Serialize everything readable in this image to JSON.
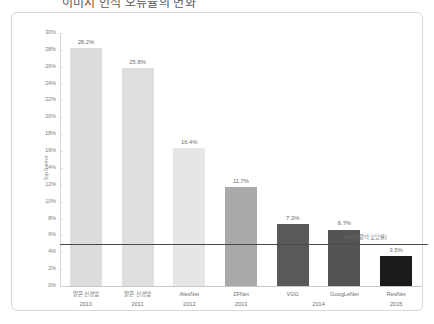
{
  "title": "이미지 인식 오류율의 변화",
  "chart_data": {
    "type": "bar",
    "title": "이미지 인식 오류율의 변화",
    "xlabel": "",
    "ylabel": "Top 5 error",
    "ylim": [
      0,
      30
    ],
    "ytick_step": 2,
    "grid": false,
    "legend": "none",
    "categories": [
      "얕은 신경망",
      "얕은 신경망",
      "AlexNet",
      "ZFNet",
      "VGG",
      "GoogLeNet",
      "ResNet"
    ],
    "values": [
      28.2,
      25.8,
      16.4,
      11.7,
      7.3,
      6.7,
      3.5
    ],
    "data_labels": [
      "28.2%",
      "25.8%",
      "16.4%",
      "11.7%",
      "7.3%",
      "6.7%",
      "3.5%"
    ],
    "years": [
      "2010",
      "2011",
      "2012",
      "2013",
      "2014",
      "2014",
      "2015"
    ],
    "year_groups": [
      {
        "label": "2010",
        "span": [
          0,
          0
        ]
      },
      {
        "label": "2011",
        "span": [
          1,
          1
        ]
      },
      {
        "label": "2012",
        "span": [
          2,
          2
        ]
      },
      {
        "label": "2013",
        "span": [
          3,
          3
        ]
      },
      {
        "label": "2014",
        "span": [
          4,
          5
        ]
      },
      {
        "label": "2015",
        "span": [
          6,
          6
        ]
      }
    ],
    "bar_colors": [
      "#dcdcdc",
      "#dedede",
      "#e6e6e6",
      "#a9a9a9",
      "#595959",
      "#545454",
      "#1a1a1a"
    ],
    "reference_line": {
      "value": 5,
      "label": "5%(사람의 오답률)",
      "color": "#4a4a4a"
    },
    "ytick_labels": [
      "0%",
      "2%",
      "4%",
      "6%",
      "8%",
      "10%",
      "12%",
      "14%",
      "16%",
      "18%",
      "20%",
      "22%",
      "24%",
      "26%",
      "28%",
      "30%"
    ]
  }
}
